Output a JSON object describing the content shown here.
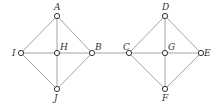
{
  "diagram": {
    "type": "graph",
    "nodes": [
      {
        "id": "A",
        "label": "A",
        "x": 57,
        "y": 16,
        "lx": 54,
        "ly": 10
      },
      {
        "id": "H",
        "label": "H",
        "x": 57,
        "y": 53,
        "lx": 60,
        "ly": 50
      },
      {
        "id": "I",
        "label": "I",
        "x": 21,
        "y": 53,
        "lx": 12,
        "ly": 56
      },
      {
        "id": "B",
        "label": "B",
        "x": 92,
        "y": 53,
        "lx": 95,
        "ly": 50
      },
      {
        "id": "J",
        "label": "J",
        "x": 57,
        "y": 89,
        "lx": 54,
        "ly": 101
      },
      {
        "id": "C",
        "label": "C",
        "x": 129,
        "y": 53,
        "lx": 123,
        "ly": 50
      },
      {
        "id": "D",
        "label": "D",
        "x": 165,
        "y": 16,
        "lx": 162,
        "ly": 10
      },
      {
        "id": "G",
        "label": "G",
        "x": 165,
        "y": 53,
        "lx": 168,
        "ly": 50
      },
      {
        "id": "E",
        "label": "E",
        "x": 201,
        "y": 53,
        "lx": 204,
        "ly": 56
      },
      {
        "id": "F",
        "label": "F",
        "x": 165,
        "y": 89,
        "lx": 162,
        "ly": 101
      }
    ],
    "edges": [
      [
        "A",
        "I"
      ],
      [
        "A",
        "B"
      ],
      [
        "A",
        "H"
      ],
      [
        "H",
        "J"
      ],
      [
        "I",
        "H"
      ],
      [
        "H",
        "B"
      ],
      [
        "I",
        "J"
      ],
      [
        "B",
        "J"
      ],
      [
        "B",
        "C"
      ],
      [
        "D",
        "C"
      ],
      [
        "D",
        "E"
      ],
      [
        "D",
        "G"
      ],
      [
        "G",
        "F"
      ],
      [
        "C",
        "G"
      ],
      [
        "G",
        "E"
      ],
      [
        "C",
        "F"
      ],
      [
        "E",
        "F"
      ]
    ]
  }
}
